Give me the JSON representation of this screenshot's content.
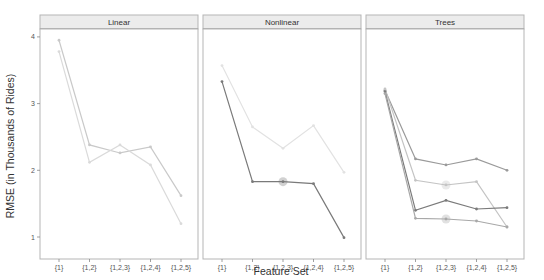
{
  "chart_data": {
    "type": "line",
    "title": "",
    "xlabel": "Feature Set",
    "ylabel": "RMSE (in Thousands of Rides)",
    "ylim": [
      0.9,
      4.1
    ],
    "yticks": [
      1,
      2,
      3,
      4
    ],
    "categories": [
      "{1}",
      "{1,2}",
      "{1,2,3}",
      "{1,2,4}",
      "{1,2,5}"
    ],
    "grid": false,
    "legend": "none",
    "panels": [
      {
        "name": "Linear",
        "series": [
          {
            "name": "Linear model A",
            "color": "#c9c9c9",
            "values": [
              3.95,
              2.38,
              2.26,
              2.35,
              1.62
            ]
          },
          {
            "name": "Linear model B",
            "color": "#dadada",
            "values": [
              3.78,
              2.12,
              2.38,
              2.08,
              1.2
            ]
          }
        ]
      },
      {
        "name": "Nonlinear",
        "series": [
          {
            "name": "Nonlinear model A",
            "color": "#e2e2e2",
            "values": [
              3.57,
              2.65,
              2.33,
              2.67,
              1.97
            ]
          },
          {
            "name": "Nonlinear model B",
            "color": "#7a7a7a",
            "values": [
              3.33,
              1.83,
              1.83,
              1.8,
              0.99
            ],
            "highlight_index": 2
          }
        ]
      },
      {
        "name": "Trees",
        "series": [
          {
            "name": "Trees model A",
            "color": "#9a9a9a",
            "values": [
              3.2,
              2.17,
              2.08,
              2.17,
              2.0
            ]
          },
          {
            "name": "Trees model B",
            "color": "#c4c4c4",
            "values": [
              3.22,
              1.85,
              1.78,
              1.83,
              1.15
            ],
            "highlight_index": 2
          },
          {
            "name": "Trees model C",
            "color": "#7a7a7a",
            "values": [
              3.18,
              1.4,
              1.55,
              1.42,
              1.44
            ]
          },
          {
            "name": "Trees model D",
            "color": "#a8a8a8",
            "values": [
              3.15,
              1.28,
              1.27,
              1.24,
              1.15
            ],
            "highlight_index": 2
          }
        ]
      }
    ]
  }
}
